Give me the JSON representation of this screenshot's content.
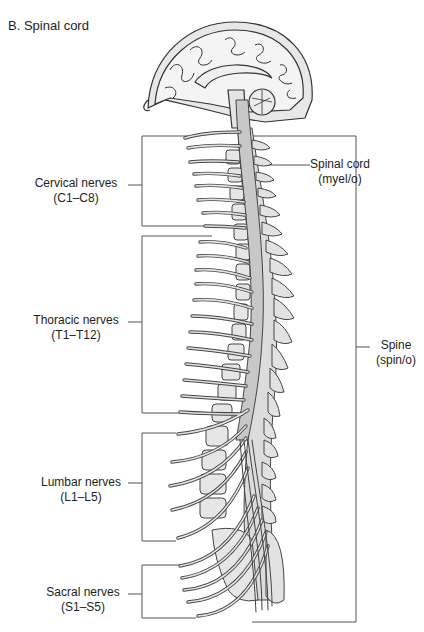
{
  "figure": {
    "title": "B.  Spinal cord"
  },
  "labels": {
    "cervical": {
      "name": "Cervical nerves",
      "range": "(C1–C8)"
    },
    "thoracic": {
      "name": "Thoracic nerves",
      "range": "(T1–T12)"
    },
    "lumbar": {
      "name": "Lumbar nerves",
      "range": "(L1–L5)"
    },
    "sacral": {
      "name": "Sacral nerves",
      "range": "(S1–S5)"
    },
    "spinal_cord": {
      "name": "Spinal cord",
      "combining_form": "(myel/o)"
    },
    "spine": {
      "name": "Spine",
      "combining_form": "(spin/o)"
    }
  },
  "colors": {
    "line": "#3a3a3a",
    "fill_light": "#dcdcdc",
    "fill_cord": "#c8c8c8",
    "background": "#ffffff"
  }
}
